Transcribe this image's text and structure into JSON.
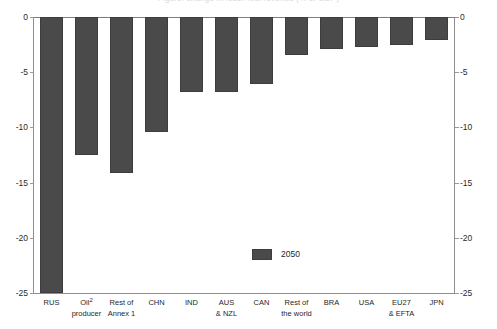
{
  "chart_data": {
    "type": "bar",
    "title": "Figure: change in fossil fuel revenue (% of GDP)",
    "xlabel": "",
    "ylabel": "",
    "ylim": [
      -25,
      0
    ],
    "yticks": [
      0,
      -5,
      -10,
      -15,
      -20,
      -25
    ],
    "ytick_labels": [
      "0",
      "-5",
      "-10",
      "-15",
      "-20",
      "-25"
    ],
    "grid": false,
    "legend_position": "inside-center-bottom",
    "dual_axis": true,
    "categories": [
      "RUS",
      "Oil 2 producer",
      "Rest of Annex 1",
      "CHN",
      "IND",
      "AUS & NZL",
      "CAN",
      "Rest of the world",
      "BRA",
      "USA",
      "EU27 & EFTA",
      "JPN"
    ],
    "series": [
      {
        "name": "2050",
        "color": "#4a4a4a",
        "values": [
          -25.0,
          -12.5,
          -14.1,
          -10.4,
          -6.8,
          -6.8,
          -6.1,
          -3.4,
          -2.9,
          -2.7,
          -2.5,
          -2.1
        ]
      }
    ]
  },
  "axis": {
    "left_labels": [
      "0",
      "-5",
      "-10",
      "-15",
      "-20",
      "-25"
    ],
    "right_labels": [
      "0",
      "-5",
      "-10",
      "-15",
      "-20",
      "-25"
    ]
  },
  "xlabels": [
    {
      "line1": "RUS",
      "line2": "",
      "sup": ""
    },
    {
      "line1": "Oil",
      "line2": "producer",
      "sup": "2"
    },
    {
      "line1": "Rest of",
      "line2": "Annex 1",
      "sup": ""
    },
    {
      "line1": "CHN",
      "line2": "",
      "sup": ""
    },
    {
      "line1": "IND",
      "line2": "",
      "sup": ""
    },
    {
      "line1": "AUS",
      "line2": "& NZL",
      "sup": ""
    },
    {
      "line1": "CAN",
      "line2": "",
      "sup": ""
    },
    {
      "line1": "Rest of",
      "line2": "the world",
      "sup": ""
    },
    {
      "line1": "BRA",
      "line2": "",
      "sup": ""
    },
    {
      "line1": "USA",
      "line2": "",
      "sup": ""
    },
    {
      "line1": "EU27",
      "line2": "& EFTA",
      "sup": ""
    },
    {
      "line1": "JPN",
      "line2": "",
      "sup": ""
    }
  ],
  "legend": {
    "label": "2050",
    "color": "#4a4a4a"
  }
}
